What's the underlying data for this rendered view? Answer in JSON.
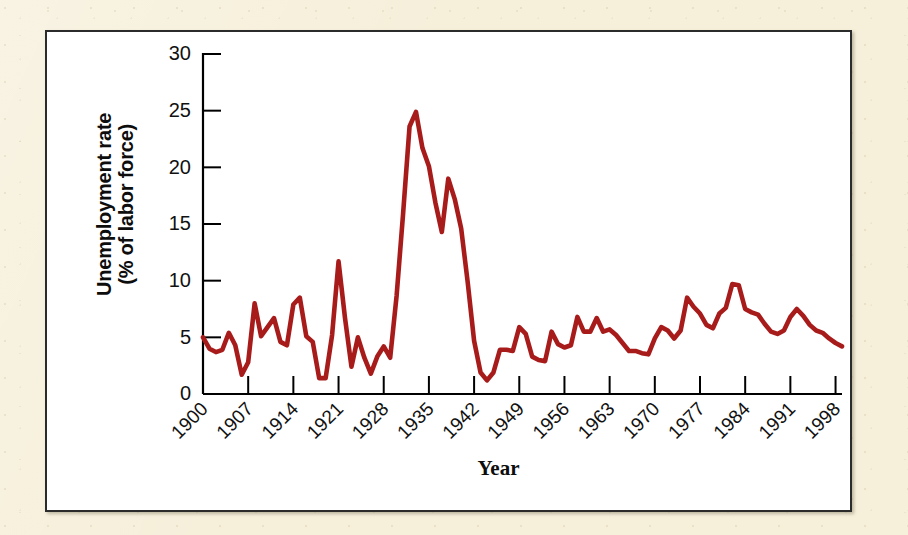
{
  "figure": {
    "background_color": "#f6efda",
    "frame_color": "#2b2b2b",
    "plot_background": "#ffffff"
  },
  "chart_data": {
    "type": "line",
    "title": "",
    "subtitle": "",
    "xlabel": "Year",
    "ylabel": "Unemployment rate\n(% of labor force)",
    "ylabel_line1": "Unemployment rate",
    "ylabel_line2": "(% of labor force)",
    "series_color": "#a81b1b",
    "grid": false,
    "legend": false,
    "legend_position": "none",
    "xlim": [
      1900,
      1999
    ],
    "ylim": [
      0,
      30
    ],
    "ytick_labels": [
      "0",
      "5",
      "10",
      "15",
      "20",
      "25",
      "30"
    ],
    "yticks": [
      0,
      5,
      10,
      15,
      20,
      25,
      30
    ],
    "xtick_labels": [
      "1900",
      "1907",
      "1914",
      "1921",
      "1928",
      "1935",
      "1942",
      "1949",
      "1956",
      "1963",
      "1970",
      "1977",
      "1984",
      "1991",
      "1998"
    ],
    "xticks": [
      1900,
      1907,
      1914,
      1921,
      1928,
      1935,
      1942,
      1949,
      1956,
      1963,
      1970,
      1977,
      1984,
      1991,
      1998
    ],
    "x": [
      1900,
      1901,
      1902,
      1903,
      1904,
      1905,
      1906,
      1907,
      1908,
      1909,
      1910,
      1911,
      1912,
      1913,
      1914,
      1915,
      1916,
      1917,
      1918,
      1919,
      1920,
      1921,
      1922,
      1923,
      1924,
      1925,
      1926,
      1927,
      1928,
      1929,
      1930,
      1931,
      1932,
      1933,
      1934,
      1935,
      1936,
      1937,
      1938,
      1939,
      1940,
      1941,
      1942,
      1943,
      1944,
      1945,
      1946,
      1947,
      1948,
      1949,
      1950,
      1951,
      1952,
      1953,
      1954,
      1955,
      1956,
      1957,
      1958,
      1959,
      1960,
      1961,
      1962,
      1963,
      1964,
      1965,
      1966,
      1967,
      1968,
      1969,
      1970,
      1971,
      1972,
      1973,
      1974,
      1975,
      1976,
      1977,
      1978,
      1979,
      1980,
      1981,
      1982,
      1983,
      1984,
      1985,
      1986,
      1987,
      1988,
      1989,
      1990,
      1991,
      1992,
      1993,
      1994,
      1995,
      1996,
      1997,
      1998,
      1999
    ],
    "values": [
      5.0,
      4.0,
      3.7,
      3.9,
      5.4,
      4.3,
      1.7,
      2.8,
      8.0,
      5.1,
      5.9,
      6.7,
      4.6,
      4.3,
      7.9,
      8.5,
      5.1,
      4.6,
      1.4,
      1.4,
      5.2,
      11.7,
      6.7,
      2.4,
      5.0,
      3.2,
      1.8,
      3.3,
      4.2,
      3.2,
      8.7,
      15.9,
      23.6,
      24.9,
      21.7,
      20.1,
      16.9,
      14.3,
      19.0,
      17.2,
      14.6,
      9.9,
      4.7,
      1.9,
      1.2,
      1.9,
      3.9,
      3.9,
      3.8,
      5.9,
      5.3,
      3.3,
      3.0,
      2.9,
      5.5,
      4.4,
      4.1,
      4.3,
      6.8,
      5.5,
      5.5,
      6.7,
      5.5,
      5.7,
      5.2,
      4.5,
      3.8,
      3.8,
      3.6,
      3.5,
      4.9,
      5.9,
      5.6,
      4.9,
      5.6,
      8.5,
      7.7,
      7.1,
      6.1,
      5.8,
      7.1,
      7.6,
      9.7,
      9.6,
      7.5,
      7.2,
      7.0,
      6.2,
      5.5,
      5.3,
      5.6,
      6.8,
      7.5,
      6.9,
      6.1,
      5.6,
      5.4,
      4.9,
      4.5,
      4.2
    ]
  }
}
